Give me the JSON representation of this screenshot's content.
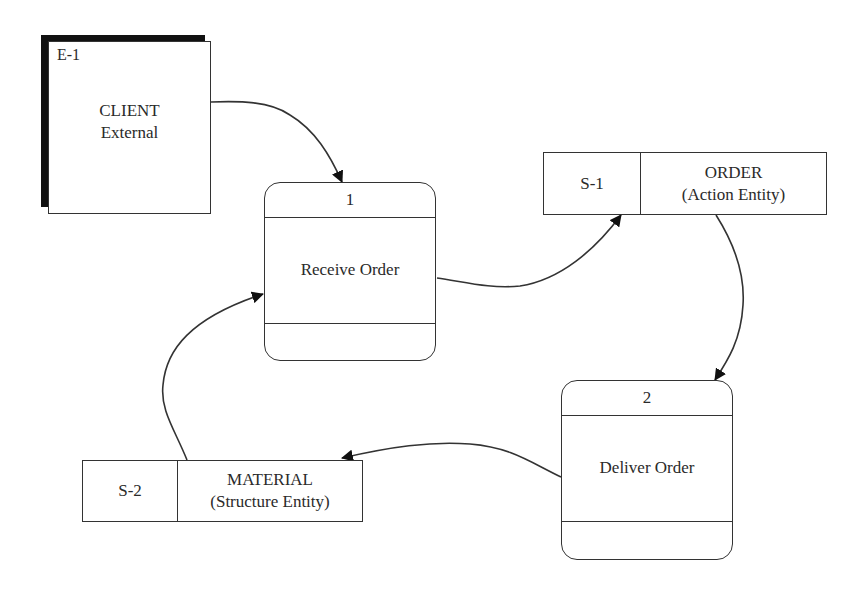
{
  "external_entity": {
    "id": "E-1",
    "name": "CLIENT",
    "type": "External"
  },
  "processes": [
    {
      "number": "1",
      "name": "Receive Order"
    },
    {
      "number": "2",
      "name": "Deliver Order"
    }
  ],
  "data_stores": [
    {
      "id": "S-1",
      "name": "ORDER",
      "type": "(Action Entity)"
    },
    {
      "id": "S-2",
      "name": "MATERIAL",
      "type": "(Structure Entity)"
    }
  ],
  "flows": [
    {
      "from": "E-1 CLIENT",
      "to": "1 Receive Order"
    },
    {
      "from": "1 Receive Order",
      "to": "S-1 ORDER"
    },
    {
      "from": "S-1 ORDER",
      "to": "2 Deliver Order"
    },
    {
      "from": "2 Deliver Order",
      "to": "S-2 MATERIAL"
    },
    {
      "from": "S-2 MATERIAL",
      "to": "1 Receive Order"
    }
  ],
  "colors": {
    "line": "#333333",
    "shadow": "#111111",
    "background": "#ffffff"
  }
}
